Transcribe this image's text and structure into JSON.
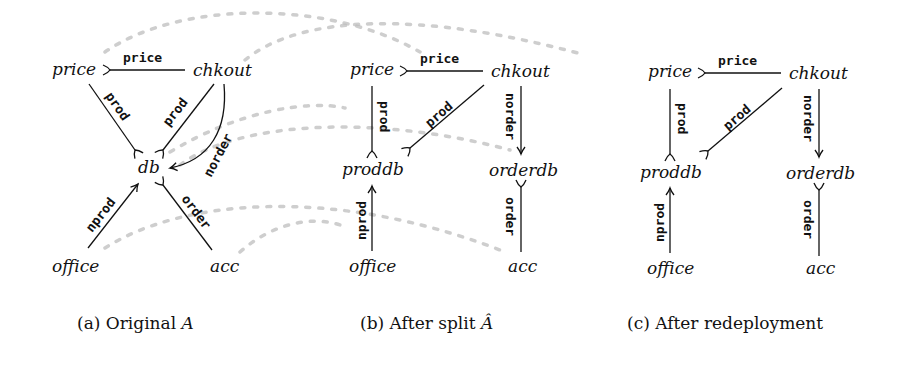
{
  "figure": {
    "panels": [
      {
        "id": "a",
        "caption": "(a) Original A",
        "caption_prefix": "(a) Original ",
        "caption_symbol": "A",
        "nodes": [
          "price",
          "chkout",
          "db",
          "office",
          "acc"
        ],
        "edges": [
          {
            "from": "chkout",
            "to": "price",
            "label": "price",
            "style": "tail-fork"
          },
          {
            "from": "price",
            "to": "db",
            "label": "prod",
            "style": "tail-fork"
          },
          {
            "from": "chkout",
            "to": "db",
            "label": "prod",
            "style": "tail-fork"
          },
          {
            "from": "chkout",
            "to": "db",
            "label": "norder",
            "style": "arrow"
          },
          {
            "from": "office",
            "to": "db",
            "label": "nprod",
            "style": "arrow"
          },
          {
            "from": "acc",
            "to": "db",
            "label": "order",
            "style": "tail-fork"
          }
        ]
      },
      {
        "id": "b",
        "caption": "(b) After split Â",
        "caption_prefix": "(b) After split ",
        "caption_symbol": "Â",
        "nodes": [
          "price",
          "chkout",
          "proddb",
          "orderdb",
          "office",
          "acc"
        ],
        "edges": [
          {
            "from": "chkout",
            "to": "price",
            "label": "price",
            "style": "tail-fork"
          },
          {
            "from": "price",
            "to": "proddb",
            "label": "prod",
            "style": "tail-fork"
          },
          {
            "from": "chkout",
            "to": "proddb",
            "label": "prod",
            "style": "tail-fork"
          },
          {
            "from": "chkout",
            "to": "orderdb",
            "label": "norder",
            "style": "arrow"
          },
          {
            "from": "office",
            "to": "proddb",
            "label": "nprod",
            "style": "arrow"
          },
          {
            "from": "acc",
            "to": "orderdb",
            "label": "order",
            "style": "tail-fork"
          }
        ]
      },
      {
        "id": "c",
        "caption": "(c) After redeployment",
        "caption_prefix": "(c) After redeployment",
        "caption_symbol": "",
        "nodes": [
          "price",
          "chkout",
          "proddb",
          "orderdb",
          "office",
          "acc"
        ],
        "edges": [
          {
            "from": "chkout",
            "to": "price",
            "label": "price",
            "style": "tail-fork"
          },
          {
            "from": "price",
            "to": "proddb",
            "label": "prod",
            "style": "tail-fork"
          },
          {
            "from": "chkout",
            "to": "proddb",
            "label": "prod",
            "style": "tail-fork"
          },
          {
            "from": "chkout",
            "to": "orderdb",
            "label": "norder",
            "style": "arrow"
          },
          {
            "from": "office",
            "to": "proddb",
            "label": "nprod",
            "style": "arrow"
          },
          {
            "from": "acc",
            "to": "orderdb",
            "label": "order",
            "style": "tail-fork"
          }
        ]
      }
    ],
    "labels": {
      "price": "price",
      "chkout": "chkout",
      "db": "db",
      "proddb": "proddb",
      "orderdb": "orderdb",
      "office": "office",
      "acc": "acc",
      "e_price": "price",
      "e_prod": "prod",
      "e_norder": "norder",
      "e_nprod": "nprod",
      "e_order": "order"
    },
    "colors": {
      "ink": "#111111",
      "dashed_mapping": "#bdbdbd",
      "background": "#ffffff"
    }
  }
}
